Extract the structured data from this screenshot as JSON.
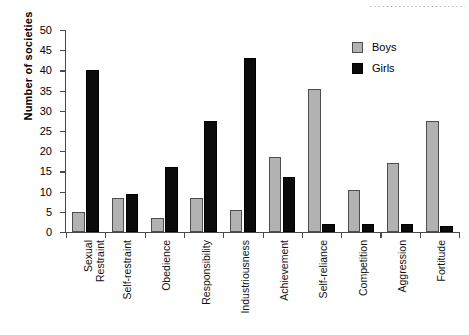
{
  "chart_data": {
    "type": "bar",
    "title": "",
    "xlabel": "",
    "ylabel": "Number of societies",
    "ylim": [
      0,
      50
    ],
    "yticks": [
      0,
      5,
      10,
      15,
      20,
      25,
      30,
      35,
      40,
      45,
      50
    ],
    "grid": false,
    "legend_position": "top-right",
    "categories": [
      "Sexual Restraint",
      "Self-restraint",
      "Obedience",
      "Responsibility",
      "Industriousness",
      "Achievement",
      "Self-reliance",
      "Competition",
      "Aggression",
      "Fortitude"
    ],
    "category_lines": [
      [
        "Sexual",
        "Restraint"
      ],
      [
        "Self-restraint"
      ],
      [
        "Obedience"
      ],
      [
        "Responsibility"
      ],
      [
        "Industriousness"
      ],
      [
        "Achievement"
      ],
      [
        "Self-reliance"
      ],
      [
        "Competition"
      ],
      [
        "Aggression"
      ],
      [
        "Fortitude"
      ]
    ],
    "series": [
      {
        "name": "Boys",
        "color": "#b2b2b2",
        "values": [
          5,
          8.5,
          3.5,
          8.5,
          5.5,
          18.5,
          35.5,
          10.5,
          17,
          27.5
        ]
      },
      {
        "name": "Girls",
        "color": "#0b0b0b",
        "values": [
          40,
          9.5,
          16,
          27.5,
          43,
          13.5,
          2,
          2,
          2,
          1.5
        ]
      }
    ]
  },
  "legend": {
    "items": [
      {
        "label": "Boys",
        "color": "#b2b2b2"
      },
      {
        "label": "Girls",
        "color": "#0b0b0b"
      }
    ]
  }
}
